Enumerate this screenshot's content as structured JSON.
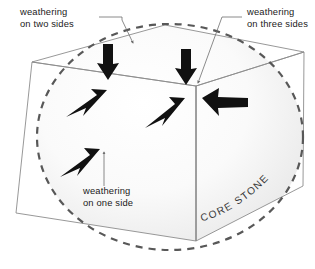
{
  "figure": {
    "type": "geology-weathering-diagram",
    "background_color": "#ffffff",
    "width": 315,
    "height": 269
  },
  "labels": {
    "two_sides_line1": "weathering",
    "two_sides_line2": "on two sides",
    "three_sides_line1": "weathering",
    "three_sides_line2": "on three sides",
    "one_side_line1": "weathering",
    "one_side_line2": "on one side",
    "core_stone": "CORE STONE"
  },
  "colors": {
    "cube_edge": "#8c8c8c",
    "sphere_dash": "#585858",
    "arrow_fill": "#111111",
    "leader_line": "#6d6d6d",
    "text": "#1a1a1a",
    "core_text": "#3a3a3a",
    "shading_light": "#f4f4f4",
    "shading_mid": "#ececec"
  },
  "cube": {
    "description": "wireframe cube in three-quarter view showing a joint block",
    "vertices": {
      "top_back": [
        165,
        25
      ],
      "top_left": [
        32,
        62
      ],
      "top_right": [
        304,
        52
      ],
      "front_top": [
        196,
        86
      ],
      "front_bottom": [
        196,
        241
      ],
      "left_bottom": [
        16,
        213
      ],
      "right_bottom": [
        303,
        186
      ],
      "left_vertical_top": [
        32,
        62
      ],
      "right_vertical_top": [
        304,
        52
      ]
    }
  },
  "core_sphere": {
    "description": "dashed ellipse representing the rounded core stone inside the block",
    "center": [
      170,
      137
    ],
    "radius_x": 133,
    "radius_y": 113,
    "dash_pattern": "7 6",
    "stroke_width": 2.2
  },
  "arrows": [
    {
      "name": "arrow-down-left",
      "from": [
        108,
        46
      ],
      "to": [
        108,
        78
      ],
      "direction": "down"
    },
    {
      "name": "arrow-down-right",
      "from": [
        186,
        50
      ],
      "to": [
        186,
        84
      ],
      "direction": "down"
    },
    {
      "name": "arrow-up-right-left",
      "from": [
        66,
        117
      ],
      "to": [
        106,
        92
      ],
      "direction": "up-right"
    },
    {
      "name": "arrow-up-right-center",
      "from": [
        146,
        127
      ],
      "to": [
        184,
        100
      ],
      "direction": "up-right"
    },
    {
      "name": "arrow-left-right-face",
      "from": [
        247,
        102
      ],
      "to": [
        203,
        97
      ],
      "direction": "left"
    },
    {
      "name": "arrow-up-right-lower",
      "from": [
        61,
        174
      ],
      "to": [
        99,
        151
      ],
      "direction": "up-right"
    }
  ],
  "leader_lines": [
    {
      "name": "leader-two-sides",
      "points": "99,18 120,18 120,22 133,44"
    },
    {
      "name": "leader-three-sides",
      "points": "241,18 222,18 198,84"
    }
  ],
  "annotations": {
    "two_sides_pos": [
      20,
      16
    ],
    "three_sides_pos": [
      246,
      16
    ],
    "one_side_pos": [
      82,
      189
    ],
    "core_stone_path_start": [
      202,
      219
    ],
    "core_stone_path_end": [
      282,
      163
    ]
  }
}
